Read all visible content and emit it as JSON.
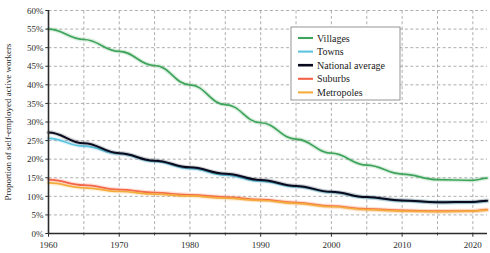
{
  "chart_data": {
    "type": "line",
    "title": "",
    "xlabel": "",
    "ylabel": "Proportion of self-employed active workers",
    "xlim": [
      1960,
      2022
    ],
    "ylim": [
      0,
      60
    ],
    "ytick_labels": [
      "0%",
      "5%",
      "10%",
      "15%",
      "20%",
      "25%",
      "30%",
      "35%",
      "40%",
      "45%",
      "50%",
      "55%",
      "60%"
    ],
    "ytick_values": [
      0,
      5,
      10,
      15,
      20,
      25,
      30,
      35,
      40,
      45,
      50,
      55,
      60
    ],
    "xtick_labels": [
      "1960",
      "1970",
      "1980",
      "1990",
      "2000",
      "2010",
      "2020"
    ],
    "xtick_values": [
      1960,
      1970,
      1980,
      1990,
      2000,
      2010,
      2020
    ],
    "xminor_values": [
      1965,
      1975,
      1985,
      1995,
      2005,
      2015
    ],
    "grid": true,
    "grid_style": "dashed",
    "legend_position": "upper-right",
    "x": [
      1960,
      1965,
      1970,
      1975,
      1980,
      1985,
      1990,
      1995,
      2000,
      2005,
      2010,
      2015,
      2020,
      2022
    ],
    "series": [
      {
        "name": "Villages",
        "color": "#3fa45b",
        "values": [
          55.0,
          52.2,
          49.0,
          45.2,
          40.0,
          34.7,
          29.8,
          25.4,
          21.6,
          18.4,
          16.0,
          14.5,
          14.3,
          14.9
        ]
      },
      {
        "name": "Towns",
        "color": "#5bc4e0",
        "values": [
          25.6,
          23.5,
          21.5,
          19.4,
          17.5,
          15.7,
          14.1,
          12.6,
          11.1,
          9.7,
          8.8,
          8.4,
          8.4,
          8.7
        ]
      },
      {
        "name": "National average",
        "color": "#0a0a1e",
        "values": [
          27.2,
          24.3,
          21.6,
          19.6,
          17.8,
          16.1,
          14.4,
          12.8,
          11.2,
          9.8,
          8.9,
          8.4,
          8.5,
          8.8
        ]
      },
      {
        "name": "Suburbs",
        "color": "#f4624a",
        "values": [
          14.5,
          13.0,
          11.8,
          11.0,
          10.4,
          9.8,
          9.1,
          8.3,
          7.4,
          6.6,
          6.2,
          6.0,
          6.1,
          6.4
        ]
      },
      {
        "name": "Metropoles",
        "color": "#f4ad3c",
        "values": [
          13.6,
          12.3,
          11.3,
          10.6,
          10.1,
          9.5,
          8.9,
          8.1,
          7.2,
          6.4,
          6.0,
          5.9,
          6.0,
          6.3
        ]
      }
    ]
  },
  "legend": {
    "items": [
      {
        "label": "Villages"
      },
      {
        "label": "Towns"
      },
      {
        "label": "National average"
      },
      {
        "label": "Suburbs"
      },
      {
        "label": "Metropoles"
      }
    ]
  },
  "colors": {
    "axis": "#2b2b2b",
    "grid": "#9a9a9a",
    "legend_border": "#8a8a8a",
    "background": "#ffffff"
  }
}
